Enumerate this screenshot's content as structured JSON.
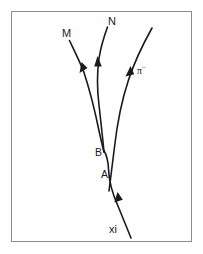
{
  "figure": {
    "background_color": "#ffffff",
    "border_color": "#8d8d8d",
    "track_color": "#1a1a1a",
    "frame": {
      "x": 11,
      "y": 11,
      "width": 181,
      "height": 231
    }
  },
  "labels": {
    "m": "M",
    "n": "N",
    "pion": "π",
    "pion_charge": "−",
    "vertex_b": "B",
    "vertex_a": "A",
    "xi": "xi"
  },
  "label_positions": {
    "m": {
      "x": 62,
      "y": 34
    },
    "n": {
      "x": 108,
      "y": 22
    },
    "pion": {
      "x": 138,
      "y": 71
    },
    "vertex_b": {
      "x": 96,
      "y": 152
    },
    "vertex_a": {
      "x": 101,
      "y": 174
    },
    "xi": {
      "x": 110,
      "y": 230
    }
  },
  "tracks": [
    {
      "name": "xi-incoming-track",
      "label": "xi",
      "path": "M 131 238 L 116 204 C 111 192 108 180 108 168 C 108 160 106 155 103 150",
      "arrow": {
        "x": 117,
        "y": 196,
        "angle": -67
      }
    },
    {
      "name": "pion-track",
      "label": "π−",
      "path": "M 152 28 C 141 45 133 62 127 80 C 120 100 116 124 114 146 C 112 162 110 178 108 190",
      "arrow": {
        "x": 129,
        "y": 72,
        "angle": -62
      }
    },
    {
      "name": "m-outgoing-track",
      "label": "M",
      "path": "M 70 41 C 75 52 80 62 84 72 C 90 90 95 112 100 134 C 102 142 103 148 104 152",
      "arrow": {
        "x": 82,
        "y": 67,
        "angle": 66
      }
    },
    {
      "name": "n-outgoing-track",
      "label": "N",
      "path": "M 108 27 C 104 38 101 48 99 58 C 97 72 97 88 99 104 C 101 122 103 140 104 152",
      "arrow": {
        "x": 99,
        "y": 61,
        "angle": -85
      }
    }
  ],
  "vertices": [
    {
      "name": "vertex-b",
      "label": "B",
      "x": 105,
      "y": 152
    },
    {
      "name": "vertex-a",
      "label": "A",
      "x": 110,
      "y": 176
    }
  ]
}
